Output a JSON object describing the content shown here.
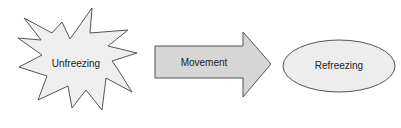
{
  "diagram": {
    "stages": [
      {
        "id": "unfreezing",
        "label": "Unfreezing",
        "shape": "starburst"
      },
      {
        "id": "movement",
        "label": "Movement",
        "shape": "block-arrow"
      },
      {
        "id": "refreezing",
        "label": "Refreezing",
        "shape": "ellipse"
      }
    ]
  },
  "colors": {
    "starburst_fill": "#efefef",
    "arrow_fill": "#d6d6d6",
    "ellipse_fill": "#ededed",
    "stroke": "#555555",
    "text": "#222222"
  }
}
